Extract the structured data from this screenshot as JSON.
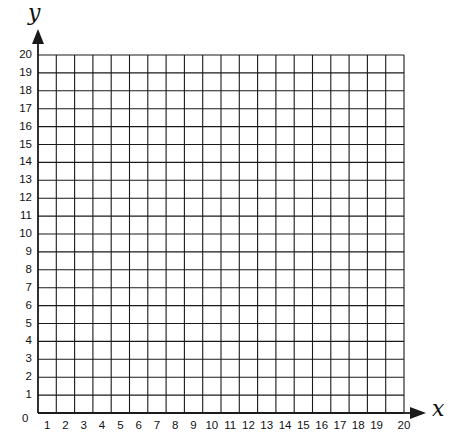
{
  "chart_data": {
    "type": "scatter",
    "title": "",
    "xlabel": "x",
    "ylabel": "y",
    "xlim": [
      0,
      20
    ],
    "ylim": [
      0,
      20
    ],
    "grid": true,
    "origin_label": "0",
    "x_ticks": [
      "1",
      "2",
      "3",
      "4",
      "5",
      "6",
      "7",
      "8",
      "9",
      "10",
      "11",
      "12",
      "13",
      "14",
      "15",
      "16",
      "17",
      "18",
      "19",
      "20"
    ],
    "y_ticks": [
      "1",
      "2",
      "3",
      "4",
      "5",
      "6",
      "7",
      "8",
      "9",
      "10",
      "11",
      "12",
      "13",
      "14",
      "15",
      "16",
      "17",
      "18",
      "19",
      "20"
    ],
    "series": [],
    "legend": null
  },
  "colors": {
    "grid_line": "#1a1a1a",
    "text": "#111111",
    "background": "#ffffff"
  }
}
